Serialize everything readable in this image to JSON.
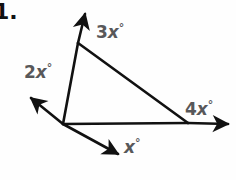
{
  "figure": {
    "type": "geometry-diagram",
    "problem_number": "1.",
    "background_color": "#fefefe",
    "stroke_color": "#111111",
    "label_color": "#58585a",
    "labels": [
      {
        "id": "3x",
        "coefficient": "3",
        "variable": "x",
        "unit": "°",
        "text": "3x°",
        "position": "interior-apex-right"
      },
      {
        "id": "2x",
        "coefficient": "2",
        "variable": "x",
        "unit": "°",
        "text": "2x°",
        "position": "exterior-upper-left"
      },
      {
        "id": "4x",
        "coefficient": "4",
        "variable": "x",
        "unit": "°",
        "text": "4x°",
        "position": "exterior-right"
      },
      {
        "id": "x",
        "coefficient": "",
        "variable": "x",
        "unit": "°",
        "text": "x°",
        "position": "exterior-lower-middle"
      }
    ],
    "vertices": {
      "apex": {
        "x": 78,
        "y": 43
      },
      "left": {
        "x": 63,
        "y": 124
      },
      "right": {
        "x": 188,
        "y": 123
      }
    },
    "rays": [
      {
        "id": "ray-up",
        "from": "apex",
        "direction": "up-right",
        "tip": {
          "x": 84,
          "y": 11
        }
      },
      {
        "id": "ray-left",
        "from": "left",
        "direction": "up-left",
        "tip": {
          "x": 28,
          "y": 95
        }
      },
      {
        "id": "ray-down",
        "from": "left",
        "direction": "down-right",
        "tip": {
          "x": 122,
          "y": 157
        }
      },
      {
        "id": "ray-right",
        "from": "right",
        "direction": "right",
        "tip": {
          "x": 232,
          "y": 124
        }
      }
    ]
  }
}
